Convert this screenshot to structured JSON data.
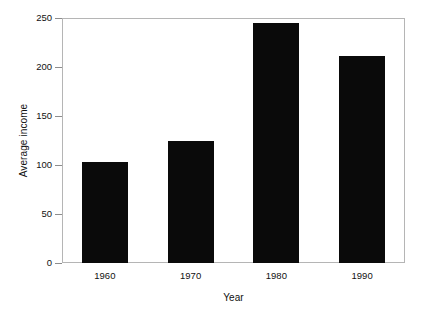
{
  "chart_data": {
    "type": "bar",
    "title": "",
    "subtitle": "",
    "categories": [
      "1960",
      "1970",
      "1980",
      "1990"
    ],
    "values": [
      103,
      125,
      245,
      211
    ],
    "xlabel": "Year",
    "ylabel": "Average income",
    "ylim": [
      0,
      250
    ],
    "yticks": [
      0,
      50,
      100,
      150,
      200,
      250
    ],
    "ytick_labels": [
      "0",
      "50",
      "100",
      "150",
      "200",
      "250"
    ],
    "xtick_labels": [
      "1960",
      "1970",
      "1980",
      "1990"
    ],
    "grid": false,
    "legend": null,
    "bar_color": "#0a0a0a",
    "background_color": "#ffffff",
    "frame_color": "#b5b5b5",
    "tick_color": "#8d8d8d",
    "text_color": "#111111"
  },
  "axes": {
    "y_title": "Average income",
    "x_title": "Year"
  }
}
